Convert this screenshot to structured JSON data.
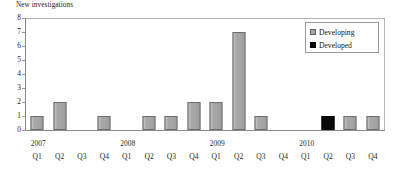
{
  "chart_data": {
    "type": "bar",
    "title": "",
    "ylabel": "New investigations",
    "xlabel": "",
    "ylim": [
      0,
      8
    ],
    "yticks": [
      8,
      7,
      6,
      5,
      4,
      3,
      2,
      1,
      0
    ],
    "grid": false,
    "legend_position": "top-right",
    "categories": [
      "2007 Q1",
      "2007 Q2",
      "2007 Q3",
      "2007 Q4",
      "2008 Q1",
      "2008 Q2",
      "2008 Q3",
      "2008 Q4",
      "2009 Q1",
      "2009 Q2",
      "2009 Q3",
      "2009 Q4",
      "2010 Q1",
      "2010 Q2",
      "2010 Q3",
      "2010 Q4"
    ],
    "quarter_labels": [
      "Q1",
      "Q2",
      "Q3",
      "Q4",
      "Q1",
      "Q2",
      "Q3",
      "Q4",
      "Q1",
      "Q2",
      "Q3",
      "Q4",
      "Q1",
      "Q2",
      "Q3",
      "Q4"
    ],
    "year_labels": [
      {
        "label": "2007",
        "index": 0
      },
      {
        "label": "2008",
        "index": 4
      },
      {
        "label": "2009",
        "index": 8
      },
      {
        "label": "2010",
        "index": 12
      }
    ],
    "series": [
      {
        "name": "Developing",
        "color": "#a6a6a6",
        "values": [
          1,
          2,
          0,
          1,
          0,
          1,
          1,
          2,
          2,
          7,
          1,
          0,
          0,
          0,
          1,
          1
        ]
      },
      {
        "name": "Developed",
        "color": "#000000",
        "values": [
          0,
          0,
          0,
          0,
          0,
          0,
          0,
          0,
          0,
          0,
          0,
          0,
          0,
          1,
          0,
          0
        ]
      }
    ]
  },
  "legend": {
    "items": [
      {
        "label": "Developing",
        "swatch": "developing"
      },
      {
        "label": "Developed",
        "swatch": "developed"
      }
    ]
  }
}
